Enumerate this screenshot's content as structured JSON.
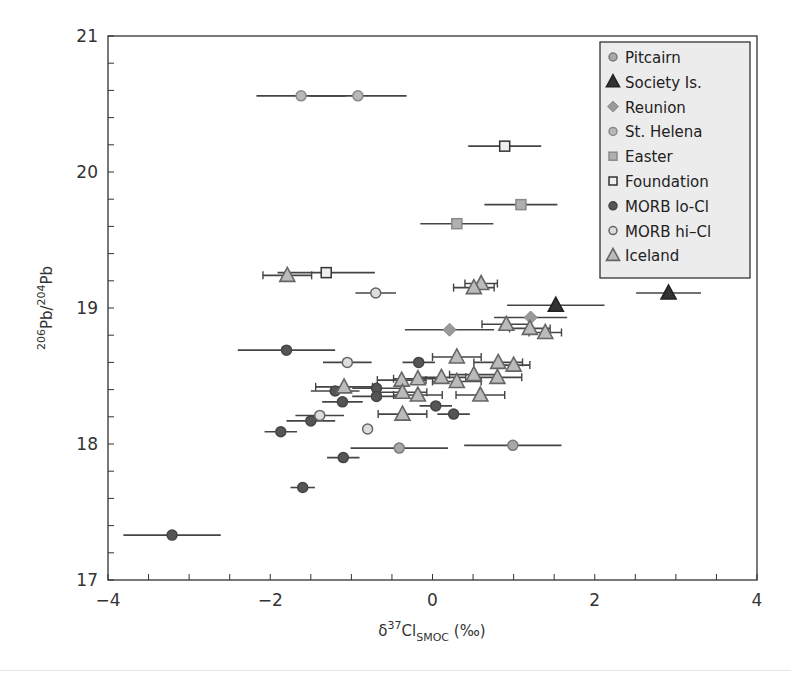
{
  "chart_data": {
    "type": "scatter",
    "title": "",
    "xlabel": "δ37Cl_SMOC (‰)",
    "xlabel_parts": {
      "delta": "δ",
      "sup": "37",
      "base": "Cl",
      "sub": "SMOC",
      "unit": " (‰)"
    },
    "ylabel": "206Pb/204Pb",
    "ylabel_parts": {
      "sup1": "206",
      "base1": "Pb/",
      "sup2": "204",
      "base2": "Pb"
    },
    "xlim": [
      -4,
      4
    ],
    "ylim": [
      17,
      21
    ],
    "xticks": [
      -4,
      -2,
      0,
      2,
      4
    ],
    "yticks": [
      17,
      18,
      19,
      20,
      21
    ],
    "x_minor_step": 0.5,
    "y_minor_step": 0.2,
    "grid": false,
    "legend_position": "upper right",
    "series": [
      {
        "name": "Pitcairn",
        "marker": "circle",
        "fill": "#a8a8a8",
        "stroke": "#7a7a7a",
        "points": [
          {
            "x": -0.41,
            "y": 17.97,
            "xerr": 0.6
          },
          {
            "x": 0.99,
            "y": 17.99,
            "xerr": 0.6
          }
        ]
      },
      {
        "name": "Society Is.",
        "marker": "triangle",
        "fill": "#333333",
        "stroke": "#222222",
        "points": [
          {
            "x": 1.52,
            "y": 19.02,
            "xerr": 0.6
          },
          {
            "x": 2.91,
            "y": 19.11,
            "xerr": 0.4
          }
        ]
      },
      {
        "name": "Reunion",
        "marker": "diamond",
        "fill": "#9a9a9a",
        "stroke": "#8a8a8a",
        "points": [
          {
            "x": 1.21,
            "y": 18.93,
            "xerr": 0.45
          },
          {
            "x": 0.21,
            "y": 18.84,
            "xerr": 0.55
          }
        ]
      },
      {
        "name": "St. Helena",
        "marker": "circle",
        "fill": "#b8b8b8",
        "stroke": "#8a8a8a",
        "points": [
          {
            "x": -1.62,
            "y": 20.56,
            "xerr": 0.55
          },
          {
            "x": -0.92,
            "y": 20.56,
            "xerr": 0.6
          }
        ]
      },
      {
        "name": "Easter",
        "marker": "square",
        "fill": "#b0b0b0",
        "stroke": "#8a8a8a",
        "points": [
          {
            "x": 0.3,
            "y": 19.62,
            "xerr": 0.45
          },
          {
            "x": 1.09,
            "y": 19.76,
            "xerr": 0.45
          }
        ]
      },
      {
        "name": "Foundation",
        "marker": "square",
        "fill": "#eeeeee",
        "stroke": "#333333",
        "points": [
          {
            "x": 0.89,
            "y": 20.19,
            "xerr": 0.45
          },
          {
            "x": -1.31,
            "y": 19.26,
            "xerr": 0.6
          }
        ]
      },
      {
        "name": "MORB lo-Cl",
        "marker": "circle",
        "fill": "#555555",
        "stroke": "#444444",
        "points": [
          {
            "x": -1.8,
            "y": 18.69,
            "xerr": 0.6
          },
          {
            "x": -0.17,
            "y": 18.6,
            "xerr": 0.2
          },
          {
            "x": -1.2,
            "y": 18.39,
            "xerr": 0.3
          },
          {
            "x": -0.69,
            "y": 18.41,
            "xerr": 0.3
          },
          {
            "x": -0.69,
            "y": 18.35,
            "xerr": 0.3
          },
          {
            "x": -1.11,
            "y": 18.31,
            "xerr": 0.25
          },
          {
            "x": 0.04,
            "y": 18.28,
            "xerr": 0.2
          },
          {
            "x": 0.26,
            "y": 18.22,
            "xerr": 0.2
          },
          {
            "x": -1.5,
            "y": 18.17,
            "xerr": 0.3
          },
          {
            "x": -1.87,
            "y": 18.09,
            "xerr": 0.2
          },
          {
            "x": -1.1,
            "y": 17.9,
            "xerr": 0.2
          },
          {
            "x": -1.6,
            "y": 17.68,
            "xerr": 0.15
          },
          {
            "x": -3.21,
            "y": 17.33,
            "xerr": 0.6
          }
        ]
      },
      {
        "name": "MORB hi-Cl",
        "marker": "circle",
        "fill": "#dddddd",
        "stroke": "#666666",
        "points": [
          {
            "x": -0.7,
            "y": 19.11,
            "xerr": 0.25
          },
          {
            "x": -1.05,
            "y": 18.6,
            "xerr": 0.3
          },
          {
            "x": -1.39,
            "y": 18.21,
            "xerr": 0.3
          },
          {
            "x": -0.8,
            "y": 18.11,
            "xerr": 0
          }
        ]
      },
      {
        "name": "Iceland",
        "marker": "triangle",
        "fill": "#bbbbbb",
        "stroke": "#666666",
        "points": [
          {
            "x": -1.79,
            "y": 19.24,
            "xerr": 0.3
          },
          {
            "x": 0.6,
            "y": 19.18,
            "xerr": 0.2
          },
          {
            "x": 0.51,
            "y": 19.15,
            "xerr": 0.25
          },
          {
            "x": 0.91,
            "y": 18.88,
            "xerr": 0.3
          },
          {
            "x": 1.2,
            "y": 18.85,
            "xerr": 0.25
          },
          {
            "x": 1.39,
            "y": 18.82,
            "xerr": 0.2
          },
          {
            "x": 0.3,
            "y": 18.64,
            "xerr": 0.3
          },
          {
            "x": 0.81,
            "y": 18.6,
            "xerr": 0.3
          },
          {
            "x": 1.0,
            "y": 18.58,
            "xerr": 0.2
          },
          {
            "x": -1.09,
            "y": 18.42,
            "xerr": 0.35
          },
          {
            "x": -0.38,
            "y": 18.47,
            "xerr": 0.3
          },
          {
            "x": -0.18,
            "y": 18.48,
            "xerr": 0.3
          },
          {
            "x": 0.11,
            "y": 18.49,
            "xerr": 0.3
          },
          {
            "x": 0.3,
            "y": 18.46,
            "xerr": 0.3
          },
          {
            "x": 0.51,
            "y": 18.51,
            "xerr": 0.3
          },
          {
            "x": 0.8,
            "y": 18.49,
            "xerr": 0.3
          },
          {
            "x": -0.37,
            "y": 18.38,
            "xerr": 0.3
          },
          {
            "x": -0.18,
            "y": 18.36,
            "xerr": 0.3
          },
          {
            "x": 0.59,
            "y": 18.36,
            "xerr": 0.3
          },
          {
            "x": -0.37,
            "y": 18.22,
            "xerr": 0.3
          }
        ]
      }
    ]
  },
  "legend": {
    "items": [
      {
        "label": "Pitcairn"
      },
      {
        "label": "Society Is."
      },
      {
        "label": "Reunion"
      },
      {
        "label": "St. Helena"
      },
      {
        "label": "Easter"
      },
      {
        "label": "Foundation"
      },
      {
        "label": "MORB lo-Cl"
      },
      {
        "label": "MORB hi–Cl"
      },
      {
        "label": "Iceland"
      }
    ],
    "background": "#ececec",
    "border": "#333333"
  },
  "layout": {
    "plot": {
      "left": 108,
      "top": 36,
      "right": 757,
      "bottom": 580
    },
    "legend_box": {
      "x": 600,
      "y": 42,
      "w": 150,
      "h": 236
    }
  }
}
